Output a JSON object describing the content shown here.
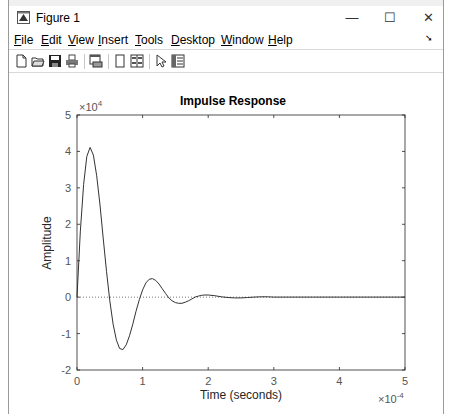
{
  "window": {
    "title": "Figure 1",
    "minimize_label": "—",
    "maximize_label": "☐",
    "close_label": "✕"
  },
  "menubar": {
    "items": [
      {
        "label": "File",
        "accel": "F",
        "rest": "ile"
      },
      {
        "label": "Edit",
        "accel": "E",
        "rest": "dit"
      },
      {
        "label": "View",
        "accel": "V",
        "rest": "iew"
      },
      {
        "label": "Insert",
        "accel": "I",
        "rest": "nsert"
      },
      {
        "label": "Tools",
        "accel": "T",
        "rest": "ools"
      },
      {
        "label": "Desktop",
        "accel": "D",
        "rest": "esktop"
      },
      {
        "label": "Window",
        "accel": "W",
        "rest": "indow"
      },
      {
        "label": "Help",
        "accel": "H",
        "rest": "elp"
      }
    ],
    "dock_icon": "dock-arrow-icon"
  },
  "toolbar": {
    "buttons": [
      "new-figure-icon",
      "open-file-icon",
      "save-icon",
      "print-icon",
      "link-plot-icon",
      "hide-plot-tools-icon",
      "show-plot-tools-icon",
      "edit-plot-arrow-icon",
      "property-inspector-icon"
    ]
  },
  "chart_data": {
    "type": "line",
    "title": "Impulse Response",
    "xlabel": "Time (seconds)",
    "ylabel": "Amplitude",
    "x_exponent": "×10",
    "x_exponent_power": "-4",
    "y_exponent": "×10",
    "y_exponent_power": "4",
    "xlim": [
      0,
      5
    ],
    "ylim": [
      -2,
      5
    ],
    "xticks": [
      "0",
      "1",
      "2",
      "3",
      "4",
      "5"
    ],
    "yticks": [
      "-2",
      "-1",
      "0",
      "1",
      "2",
      "3",
      "4",
      "5"
    ],
    "grid": false,
    "legend": null,
    "zero_line": "dotted",
    "series": [
      {
        "name": "impulse",
        "x": [
          0,
          0.05,
          0.1,
          0.15,
          0.2,
          0.25,
          0.3,
          0.35,
          0.4,
          0.45,
          0.5,
          0.55,
          0.6,
          0.65,
          0.7,
          0.75,
          0.8,
          0.85,
          0.9,
          0.95,
          1.0,
          1.05,
          1.1,
          1.15,
          1.2,
          1.25,
          1.3,
          1.35,
          1.4,
          1.45,
          1.5,
          1.55,
          1.6,
          1.65,
          1.7,
          1.75,
          1.8,
          1.85,
          1.9,
          1.95,
          2.0,
          2.1,
          2.2,
          2.3,
          2.4,
          2.5,
          2.6,
          2.7,
          2.8,
          2.9,
          3.0,
          3.2,
          3.4,
          3.6,
          3.8,
          4.0,
          4.5,
          5.0
        ],
        "y": [
          0,
          1.79,
          3.09,
          3.86,
          4.11,
          3.9,
          3.33,
          2.53,
          1.62,
          0.71,
          -0.1,
          -0.74,
          -1.18,
          -1.41,
          -1.44,
          -1.31,
          -1.06,
          -0.74,
          -0.39,
          -0.07,
          0.2,
          0.39,
          0.49,
          0.51,
          0.46,
          0.36,
          0.23,
          0.1,
          -0.02,
          -0.1,
          -0.15,
          -0.17,
          -0.17,
          -0.14,
          -0.1,
          -0.05,
          0.0,
          0.03,
          0.05,
          0.06,
          0.06,
          0.04,
          0.01,
          -0.01,
          -0.02,
          -0.02,
          -0.01,
          0.0,
          0.01,
          0.01,
          0.0,
          0.0,
          0.0,
          0.0,
          0.0,
          0.0,
          0.0,
          0.0
        ]
      }
    ]
  }
}
